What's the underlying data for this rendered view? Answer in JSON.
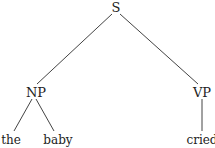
{
  "tree": {
    "root": {
      "label": "S"
    },
    "np": {
      "label": "NP"
    },
    "vp": {
      "label": "VP"
    },
    "leaves": {
      "the": "the",
      "baby": "baby",
      "cried": "cried"
    }
  },
  "colors": {
    "line": "#444444",
    "text": "#222222"
  }
}
